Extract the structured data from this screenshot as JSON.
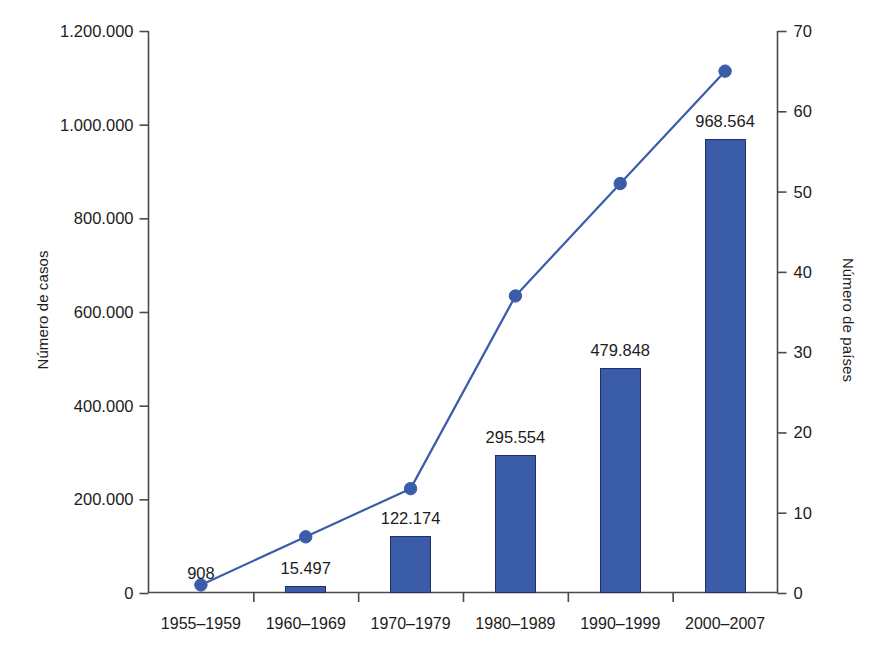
{
  "chart_data": {
    "type": "bar",
    "title": "",
    "subtitle": "",
    "xlabel": "",
    "ylabel": "Número de casos",
    "y2label": "Número de países",
    "categories": [
      "1955–1959",
      "1960–1969",
      "1970–1979",
      "1980–1989",
      "1990–1999",
      "2000–2007"
    ],
    "grid": false,
    "legend": "none",
    "ylim": [
      0,
      1200000
    ],
    "y2lim": [
      0,
      70
    ],
    "yticks": [
      0,
      200000,
      400000,
      600000,
      800000,
      1000000,
      1200000
    ],
    "ytick_labels": [
      "0",
      "200.000",
      "400.000",
      "600.000",
      "800.000",
      "1.000.000",
      "1.200.000"
    ],
    "y2ticks": [
      0,
      10,
      20,
      30,
      40,
      50,
      60,
      70
    ],
    "y2tick_labels": [
      "0",
      "10",
      "20",
      "30",
      "40",
      "50",
      "60",
      "70"
    ],
    "series": [
      {
        "name": "Número de casos",
        "kind": "bar",
        "axis": "left",
        "color": "#3a5ca8",
        "edge_color": "#21306b",
        "values": [
          908,
          15497,
          122174,
          295554,
          479848,
          968564
        ],
        "data_labels": [
          "908",
          "15.497",
          "122.174",
          "295.554",
          "479.848",
          "968.564"
        ]
      },
      {
        "name": "Número de países",
        "kind": "line",
        "axis": "right",
        "color": "#3b5ca9",
        "marker": "circle",
        "values": [
          1,
          7,
          13,
          37,
          51,
          65
        ],
        "data_labels": []
      }
    ]
  },
  "axes": {
    "left_title": "Número de casos",
    "right_title": "Número de países"
  }
}
